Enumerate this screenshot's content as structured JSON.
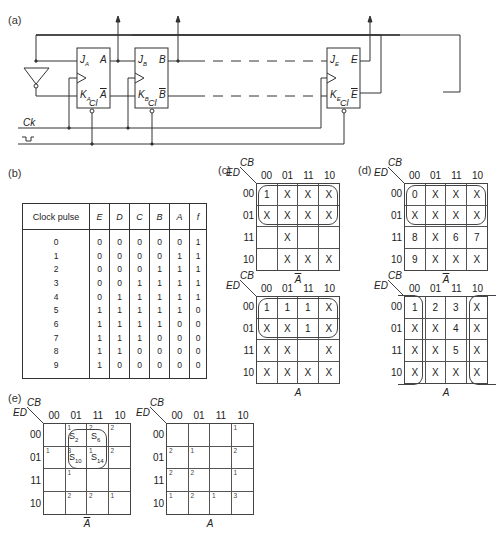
{
  "panels": {
    "a": {
      "label": "(a)",
      "flipflops": [
        {
          "j": "J",
          "j_sub": "A",
          "k": "K",
          "k_sub": "A",
          "q": "A",
          "qbar": "A",
          "cl": "Cl"
        },
        {
          "j": "J",
          "j_sub": "B",
          "k": "K",
          "k_sub": "B",
          "q": "B",
          "qbar": "B",
          "cl": "Cl"
        },
        {
          "j": "J",
          "j_sub": "E",
          "k": "K",
          "k_sub": "E",
          "q": "E",
          "qbar": "E",
          "cl": "Cl"
        }
      ],
      "clock_label": "Ck"
    },
    "b": {
      "label": "(b)",
      "table": {
        "headers": [
          "Clock pulse",
          "E",
          "D",
          "C",
          "B",
          "A",
          "f"
        ],
        "rows": [
          [
            "0",
            "0",
            "0",
            "0",
            "0",
            "0",
            "1"
          ],
          [
            "1",
            "0",
            "0",
            "0",
            "0",
            "1",
            "1"
          ],
          [
            "2",
            "0",
            "0",
            "0",
            "1",
            "1",
            "1"
          ],
          [
            "3",
            "0",
            "0",
            "1",
            "1",
            "1",
            "1"
          ],
          [
            "4",
            "0",
            "1",
            "1",
            "1",
            "1",
            "1"
          ],
          [
            "5",
            "1",
            "1",
            "1",
            "1",
            "1",
            "0"
          ],
          [
            "6",
            "1",
            "1",
            "1",
            "1",
            "0",
            "0"
          ],
          [
            "7",
            "1",
            "1",
            "1",
            "0",
            "0",
            "0"
          ],
          [
            "8",
            "1",
            "1",
            "0",
            "0",
            "0",
            "0"
          ],
          [
            "9",
            "1",
            "0",
            "0",
            "0",
            "0",
            "0"
          ]
        ]
      }
    },
    "c": {
      "label": "(c)",
      "col_var": "CB",
      "row_var": "ED",
      "col_headers": [
        "00",
        "01",
        "11",
        "10"
      ],
      "row_headers": [
        "00",
        "01",
        "11",
        "10"
      ],
      "maps": [
        {
          "caption": "A",
          "caption_bar": true,
          "cells": [
            [
              "1",
              "X",
              "X",
              "X"
            ],
            [
              "X",
              "X",
              "X",
              "X"
            ],
            [
              "",
              "X",
              "",
              ""
            ],
            [
              "",
              "X",
              "X",
              "X"
            ]
          ]
        },
        {
          "caption": "A",
          "caption_bar": false,
          "cells": [
            [
              "1",
              "1",
              "1",
              "X"
            ],
            [
              "X",
              "X",
              "1",
              "X"
            ],
            [
              "X",
              "X",
              "",
              "X"
            ],
            [
              "X",
              "X",
              "X",
              "X"
            ]
          ]
        }
      ]
    },
    "d": {
      "label": "(d)",
      "col_var": "CB",
      "row_var": "ED",
      "col_headers": [
        "00",
        "01",
        "11",
        "10"
      ],
      "row_headers": [
        "00",
        "01",
        "11",
        "10"
      ],
      "maps": [
        {
          "caption": "A",
          "caption_bar": true,
          "cells": [
            [
              "0",
              "X",
              "X",
              "X"
            ],
            [
              "X",
              "X",
              "X",
              "X"
            ],
            [
              "8",
              "X",
              "6",
              "7"
            ],
            [
              "9",
              "X",
              "X",
              "X"
            ]
          ]
        },
        {
          "caption": "A",
          "caption_bar": false,
          "cells": [
            [
              "1",
              "2",
              "3",
              "X"
            ],
            [
              "X",
              "X",
              "4",
              "X"
            ],
            [
              "X",
              "X",
              "5",
              "X"
            ],
            [
              "X",
              "X",
              "X",
              "X"
            ]
          ]
        }
      ]
    },
    "e": {
      "label": "(e)",
      "col_var": "CB",
      "row_var": "ED",
      "col_headers": [
        "00",
        "01",
        "11",
        "10"
      ],
      "row_headers": [
        "00",
        "01",
        "11",
        "10"
      ],
      "maps": [
        {
          "caption": "A",
          "caption_bar": true,
          "corners": [
            [
              "",
              "1",
              "2",
              "2"
            ],
            [
              "1",
              "3",
              "1",
              "2"
            ],
            [
              "",
              "1",
              "",
              ""
            ],
            [
              "",
              "2",
              "2",
              "1"
            ]
          ],
          "states": [
            {
              "name": "S",
              "sub": "2"
            },
            {
              "name": "S",
              "sub": "6"
            },
            {
              "name": "S",
              "sub": "10"
            },
            {
              "name": "S",
              "sub": "14"
            }
          ]
        },
        {
          "caption": "A",
          "caption_bar": false,
          "corners": [
            [
              "",
              "",
              "",
              "1"
            ],
            [
              "2",
              "1",
              "",
              "2"
            ],
            [
              "2",
              "2",
              "",
              "1"
            ],
            [
              "1",
              "2",
              "1",
              "3"
            ]
          ]
        }
      ]
    }
  }
}
